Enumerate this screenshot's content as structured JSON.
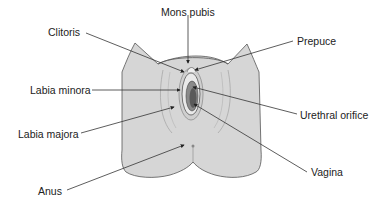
{
  "figure": {
    "type": "anatomical-diagram",
    "colors": {
      "skin": "#d6d6d6",
      "outline": "#555555",
      "leader": "#333333",
      "inner_dark": "#6a6a6a",
      "text": "#222222"
    },
    "labels": [
      {
        "id": "mons-pubis",
        "text": "Mons pubis",
        "x": 161,
        "y": 6
      },
      {
        "id": "clitoris",
        "text": "Clitoris",
        "x": 48,
        "y": 26
      },
      {
        "id": "prepuce",
        "text": "Prepuce",
        "x": 297,
        "y": 35
      },
      {
        "id": "labia-minora",
        "text": "Labia minora",
        "x": 30,
        "y": 84
      },
      {
        "id": "urethral-orifice",
        "text": "Urethral orifice",
        "x": 300,
        "y": 109
      },
      {
        "id": "labia-majora",
        "text": "Labia majora",
        "x": 18,
        "y": 128
      },
      {
        "id": "vagina",
        "text": "Vagina",
        "x": 311,
        "y": 166
      },
      {
        "id": "anus",
        "text": "Anus",
        "x": 38,
        "y": 185
      }
    ]
  }
}
